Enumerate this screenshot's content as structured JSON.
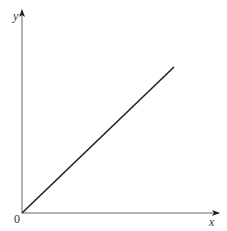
{
  "diagram": {
    "type": "line-graph",
    "axes": {
      "x_label": "x",
      "y_label": "y",
      "origin_label": "0"
    },
    "line": {
      "description": "straight line through origin with positive slope",
      "start": [
        0,
        0
      ],
      "end_direction": "up-right"
    },
    "colors": {
      "axes": "#555555",
      "line": "#222222"
    }
  }
}
